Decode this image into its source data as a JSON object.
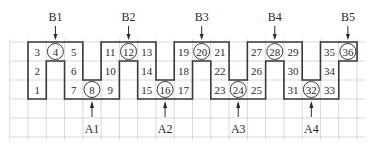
{
  "diagram": {
    "grid": {
      "origin_x": 28,
      "origin_y": 42,
      "cell_w": 18.28,
      "cell_h": 19,
      "columns": 18,
      "rows": 3,
      "extended_rows_below": 2,
      "grid_x_start": 10,
      "grid_x_end": 366,
      "grid_color": "#c8c8c8",
      "outline_color": "#3a3a3a"
    },
    "cells": [
      {
        "n": "1",
        "col": 0,
        "row": 2,
        "circled": false
      },
      {
        "n": "2",
        "col": 0,
        "row": 1,
        "circled": false
      },
      {
        "n": "3",
        "col": 0,
        "row": 0,
        "circled": false
      },
      {
        "n": "4",
        "col": 1,
        "row": 0,
        "circled": true
      },
      {
        "n": "5",
        "col": 2,
        "row": 0,
        "circled": false
      },
      {
        "n": "6",
        "col": 2,
        "row": 1,
        "circled": false
      },
      {
        "n": "7",
        "col": 2,
        "row": 2,
        "circled": false
      },
      {
        "n": "8",
        "col": 3,
        "row": 2,
        "circled": true
      },
      {
        "n": "9",
        "col": 4,
        "row": 2,
        "circled": false
      },
      {
        "n": "10",
        "col": 4,
        "row": 1,
        "circled": false
      },
      {
        "n": "11",
        "col": 4,
        "row": 0,
        "circled": false
      },
      {
        "n": "12",
        "col": 5,
        "row": 0,
        "circled": true
      },
      {
        "n": "13",
        "col": 6,
        "row": 0,
        "circled": false
      },
      {
        "n": "14",
        "col": 6,
        "row": 1,
        "circled": false
      },
      {
        "n": "15",
        "col": 6,
        "row": 2,
        "circled": false
      },
      {
        "n": "16",
        "col": 7,
        "row": 2,
        "circled": true
      },
      {
        "n": "17",
        "col": 8,
        "row": 2,
        "circled": false
      },
      {
        "n": "18",
        "col": 8,
        "row": 1,
        "circled": false
      },
      {
        "n": "19",
        "col": 8,
        "row": 0,
        "circled": false
      },
      {
        "n": "20",
        "col": 9,
        "row": 0,
        "circled": true
      },
      {
        "n": "21",
        "col": 10,
        "row": 0,
        "circled": false
      },
      {
        "n": "22",
        "col": 10,
        "row": 1,
        "circled": false
      },
      {
        "n": "23",
        "col": 10,
        "row": 2,
        "circled": false
      },
      {
        "n": "24",
        "col": 11,
        "row": 2,
        "circled": true
      },
      {
        "n": "25",
        "col": 12,
        "row": 2,
        "circled": false
      },
      {
        "n": "26",
        "col": 12,
        "row": 1,
        "circled": false
      },
      {
        "n": "27",
        "col": 12,
        "row": 0,
        "circled": false
      },
      {
        "n": "28",
        "col": 13,
        "row": 0,
        "circled": true
      },
      {
        "n": "29",
        "col": 14,
        "row": 0,
        "circled": false
      },
      {
        "n": "30",
        "col": 14,
        "row": 1,
        "circled": false
      },
      {
        "n": "31",
        "col": 14,
        "row": 2,
        "circled": false
      },
      {
        "n": "32",
        "col": 15,
        "row": 2,
        "circled": true
      },
      {
        "n": "33",
        "col": 16,
        "row": 2,
        "circled": false
      },
      {
        "n": "34",
        "col": 16,
        "row": 1,
        "circled": false
      },
      {
        "n": "35",
        "col": 16,
        "row": 0,
        "circled": false
      },
      {
        "n": "36",
        "col": 17,
        "row": 0,
        "circled": true
      }
    ],
    "top_labels": [
      {
        "label": "B1",
        "col": 1
      },
      {
        "label": "B2",
        "col": 5
      },
      {
        "label": "B3",
        "col": 9
      },
      {
        "label": "B4",
        "col": 13
      },
      {
        "label": "B5",
        "col": 17
      }
    ],
    "bottom_labels": [
      {
        "label": "A1",
        "col": 3
      },
      {
        "label": "A2",
        "col": 7
      },
      {
        "label": "A3",
        "col": 11
      },
      {
        "label": "A4",
        "col": 15
      }
    ]
  }
}
